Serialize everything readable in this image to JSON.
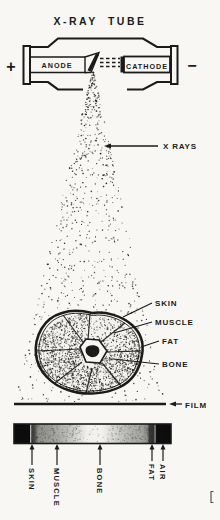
{
  "title": "X-RAY TUBE",
  "tube": {
    "anode": "ANODE",
    "cathode": "CATHODE",
    "polarity_left": "+",
    "polarity_right": "−"
  },
  "beam": {
    "label": "X RAYS"
  },
  "cross_section": {
    "skin": "SKIN",
    "muscle": "MUSCLE",
    "fat": "FAT",
    "bone": "BONE"
  },
  "film": {
    "label": "FILM"
  },
  "strip": {
    "skin": "SKIN",
    "muscle": "MUSCLE",
    "bone": "BONE",
    "fat": "FAT",
    "air": "AIR"
  },
  "colors": {
    "ink": "#1b1b1b",
    "paper": "#f8f7f3"
  }
}
